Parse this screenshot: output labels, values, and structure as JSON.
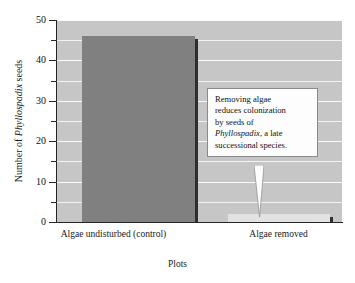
{
  "chart_data": {
    "type": "bar",
    "title": "",
    "categories": [
      "Algae undisturbed (control)",
      "Algae removed"
    ],
    "values": [
      46,
      2
    ],
    "xlabel": "Plots",
    "ylabel_prefix": "Number of ",
    "ylabel_italic": "Phyllospadix",
    "ylabel_suffix": " seeds",
    "ylim": [
      0,
      50
    ],
    "yticks": [
      0,
      10,
      20,
      30,
      40,
      50
    ],
    "ytick_labels": [
      "0",
      "10",
      "20",
      "30",
      "40",
      "50"
    ],
    "yminor_ticks": [
      5,
      15,
      25,
      35,
      45
    ],
    "grid": true,
    "grid_interval": 5,
    "legend": "none",
    "series": [
      {
        "name": "seeds",
        "values": [
          46,
          2
        ],
        "colors": [
          "#808080",
          "#e2e2e2"
        ]
      }
    ],
    "annotations": [
      {
        "id": "callout",
        "line1": "Removing algae",
        "line2": "reduces colonization",
        "line3": "by seeds of",
        "line4_italic": "Phyllospadix",
        "line4_rest": ", a late",
        "line5": "successional species.",
        "points_to": "Algae removed"
      }
    ],
    "colors": {
      "plot_background": "#c6c6c6",
      "gridline": "#f4f4f4",
      "bar_control": "#808080",
      "bar_removed": "#e2e2e2",
      "bar_shadow": "#2e2e2e",
      "axis": "#262626",
      "annotation_background": "#fdfdfd",
      "annotation_border": "#8a8a8a",
      "text": "#111111"
    }
  }
}
